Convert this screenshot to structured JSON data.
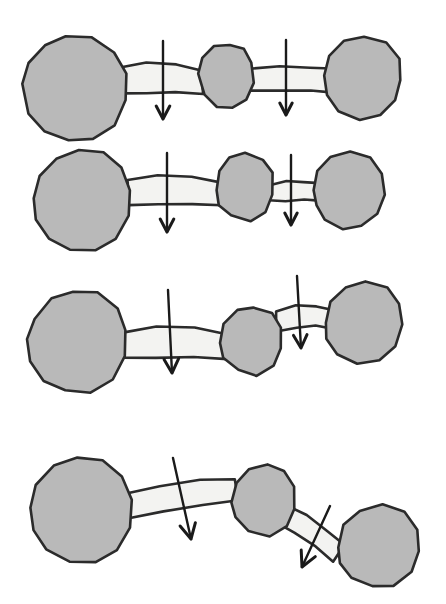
{
  "figure": {
    "background_color": "#ffffff",
    "blob_fill": "#b9b9b9",
    "blob_stroke": "#2b2b2b",
    "link_fill": "#f3f3f1",
    "link_stroke": "#2b2b2b",
    "arrow_color": "#1a1a1a",
    "blob_stroke_width": 2.6,
    "link_stroke_width": 2.6,
    "arrow_stroke_width": 2.4,
    "width": 446,
    "height": 604,
    "row_count": 4,
    "blobs_per_row": 3,
    "links_per_row": 2,
    "arrows_per_row": 2
  },
  "rows": [
    {
      "id": "row-1",
      "label": "Row 1 — straight chain, large end blobs, equal horizontal links",
      "blobs": [
        {
          "name": "blob-left",
          "cx": 74,
          "cy": 88,
          "rx": 53,
          "ry": 52,
          "rotation": 8,
          "points": "22,84 28,62 45,45 66,37 92,38 114,52 126,74 125,100 114,125 94,139 68,140 44,131 28,113"
        },
        {
          "name": "blob-middle",
          "cx": 225,
          "cy": 78,
          "rx": 27,
          "ry": 31,
          "rotation": -5,
          "points": "199,74 203,57 214,47 229,44 243,49 252,63 253,83 246,99 233,108 217,106 204,95"
        },
        {
          "name": "blob-right",
          "cx": 362,
          "cy": 78,
          "rx": 39,
          "ry": 42,
          "rotation": 6,
          "points": "324,76 329,55 344,41 364,36 386,42 399,58 401,80 395,101 380,116 359,120 338,112 327,96"
        }
      ],
      "links": [
        {
          "name": "link-left",
          "x1": 120,
          "y1": 80,
          "x2": 203,
          "y2": 82,
          "thickness": 25,
          "angle": 1,
          "points": "120,68 146,63 176,64 202,70 203,94 176,92 146,93 121,93"
        },
        {
          "name": "link-right",
          "x1": 249,
          "y1": 80,
          "x2": 330,
          "y2": 80,
          "thickness": 23,
          "angle": 0,
          "points": "249,69 280,67 310,68 331,69 331,92 310,91 280,91 249,91"
        }
      ],
      "arrows": [
        {
          "name": "arrow-left",
          "x1": 163,
          "y1": 41,
          "x2": 163,
          "y2": 119,
          "angle": 0,
          "head_size": 13
        },
        {
          "name": "arrow-right",
          "x1": 286,
          "y1": 40,
          "x2": 286,
          "y2": 115,
          "angle": 0,
          "head_size": 12
        }
      ]
    },
    {
      "id": "row-2",
      "label": "Row 2 — straight chain, shorter thinner right link, right blob pulled left",
      "blobs": [
        {
          "name": "blob-left",
          "cx": 84,
          "cy": 200,
          "rx": 50,
          "ry": 50,
          "rotation": 10,
          "points": "34,198 40,176 57,158 79,150 104,152 122,167 130,190 128,216 116,238 95,250 70,249 48,238 36,219"
        },
        {
          "name": "blob-middle",
          "cx": 243,
          "cy": 190,
          "rx": 28,
          "ry": 33,
          "rotation": -4,
          "points": "216,190 219,171 230,158 246,153 262,159 272,173 272,194 265,212 250,221 232,216 219,205"
        },
        {
          "name": "blob-right",
          "cx": 348,
          "cy": 192,
          "rx": 35,
          "ry": 38,
          "rotation": 5,
          "points": "314,190 318,171 331,157 350,152 370,158 382,173 384,194 377,213 362,226 343,229 325,220 316,206"
        }
      ],
      "links": [
        {
          "name": "link-left",
          "x1": 128,
          "y1": 192,
          "x2": 222,
          "y2": 194,
          "thickness": 25,
          "angle": 1,
          "points": "128,180 158,175 192,176 222,183 222,206 192,204 158,205 129,205"
        },
        {
          "name": "link-right",
          "x1": 268,
          "y1": 192,
          "x2": 318,
          "y2": 192,
          "thickness": 18,
          "angle": 0,
          "points": "268,185 286,181 304,182 319,183 319,201 304,200 286,201 268,201"
        }
      ],
      "arrows": [
        {
          "name": "arrow-left",
          "x1": 167,
          "y1": 153,
          "x2": 167,
          "y2": 232,
          "angle": 0,
          "head_size": 13
        },
        {
          "name": "arrow-right",
          "x1": 291,
          "y1": 155,
          "x2": 291,
          "y2": 225,
          "angle": 0,
          "head_size": 12
        }
      ]
    },
    {
      "id": "row-3",
      "label": "Row 3 — right link raised above axis, right blob lifted up",
      "blobs": [
        {
          "name": "blob-left",
          "cx": 78,
          "cy": 343,
          "rx": 50,
          "ry": 51,
          "rotation": 9,
          "points": "28,340 34,318 51,299 73,291 98,293 117,308 126,331 124,357 112,380 91,392 66,391 44,380 31,361"
        },
        {
          "name": "blob-middle",
          "cx": 250,
          "cy": 343,
          "rx": 31,
          "ry": 32,
          "rotation": -6,
          "points": "220,342 224,323 237,310 254,307 271,313 281,328 281,349 273,366 257,375 238,370 224,357"
        },
        {
          "name": "blob-right",
          "cx": 361,
          "cy": 324,
          "rx": 38,
          "ry": 39,
          "rotation": 7,
          "points": "325,322 330,301 345,287 365,281 387,287 400,303 402,325 395,346 379,360 358,363 338,354 327,339"
        }
      ],
      "links": [
        {
          "name": "link-left",
          "x1": 122,
          "y1": 345,
          "x2": 226,
          "y2": 347,
          "thickness": 26,
          "angle": 1,
          "points": "122,332 156,327 194,328 227,334 227,359 194,357 156,358 123,358"
        },
        {
          "name": "link-right",
          "x1": 276,
          "y1": 320,
          "x2": 330,
          "y2": 318,
          "thickness": 19,
          "angle": -2,
          "points": "276,312 296,306 316,306 331,309 331,328 316,326 296,327 277,331"
        }
      ],
      "arrows": [
        {
          "name": "arrow-left",
          "x1": 168,
          "y1": 290,
          "x2": 172,
          "y2": 373,
          "angle": 2,
          "head_size": 14
        },
        {
          "name": "arrow-right",
          "x1": 297,
          "y1": 276,
          "x2": 301,
          "y2": 348,
          "angle": 3,
          "head_size": 13
        }
      ]
    },
    {
      "id": "row-4",
      "label": "Row 4 — bent chain, left link tilted down-right, right link steeply angled down-right",
      "blobs": [
        {
          "name": "blob-left",
          "cx": 82,
          "cy": 511,
          "rx": 52,
          "ry": 52,
          "rotation": 10,
          "points": "30,508 36,485 54,466 77,458 103,460 122,476 131,500 129,527 117,550 95,563 69,562 46,550 33,530"
        },
        {
          "name": "blob-middle",
          "cx": 263,
          "cy": 503,
          "rx": 32,
          "ry": 33,
          "rotation": -8,
          "points": "232,503 236,483 249,469 268,465 285,472 295,487 295,509 286,527 269,537 249,531 235,518"
        },
        {
          "name": "blob-right",
          "cx": 379,
          "cy": 548,
          "rx": 41,
          "ry": 40,
          "rotation": 12,
          "points": "338,548 344,525 360,510 382,505 404,512 417,529 419,551 411,572 394,585 372,587 351,577 340,563"
        }
      ],
      "links": [
        {
          "name": "link-left",
          "x1": 126,
          "y1": 503,
          "x2": 236,
          "y2": 490,
          "thickness": 26,
          "angle": -7,
          "points": "126,494 160,486 200,480 235,480 238,501 202,505 164,511 129,519"
        },
        {
          "name": "link-right",
          "x1": 290,
          "y1": 514,
          "x2": 347,
          "y2": 553,
          "thickness": 22,
          "angle": 35,
          "points": "288,506 306,515 327,530 345,545 333,562 315,547 294,533 278,523"
        }
      ],
      "arrows": [
        {
          "name": "arrow-left",
          "x1": 173,
          "y1": 458,
          "x2": 191,
          "y2": 539,
          "angle": 12,
          "head_size": 15
        },
        {
          "name": "arrow-right",
          "x1": 330,
          "y1": 506,
          "x2": 302,
          "y2": 567,
          "angle": -24,
          "head_size": 15
        }
      ]
    }
  ]
}
